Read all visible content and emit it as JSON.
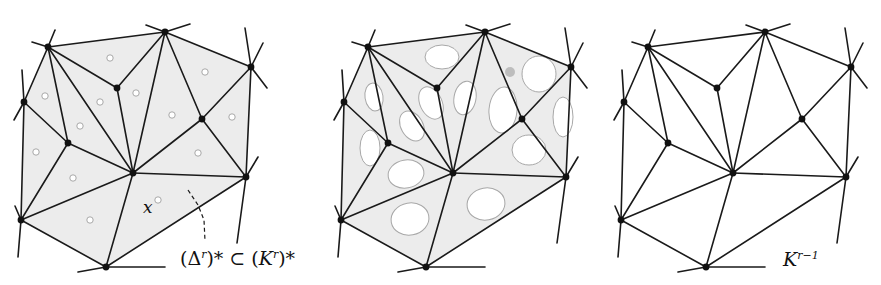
{
  "figure": {
    "panels": [
      {
        "id": "panel-1",
        "offset_x": 0,
        "description": "dual complex (Δ^r)* shaded with small cycles"
      },
      {
        "id": "panel-2",
        "offset_x": 320,
        "description": "shaded faces with enlarged cycles"
      },
      {
        "id": "panel-3",
        "offset_x": 600,
        "description": "unshaded complex K^{r-1}"
      }
    ],
    "labels": {
      "point_x": "x",
      "dual_left": "(Δ",
      "dual_sup1": "r",
      "dual_mid": ")* ⊂ (",
      "dual_K": "K",
      "dual_sup2": "r",
      "dual_end": ")*",
      "k_base": "K",
      "k_sup": "r−1"
    },
    "colors": {
      "edge": "#1a1a1a",
      "vertex": "#111111",
      "face_fill": "#ececec",
      "cycle_stroke": "#a8a8a8",
      "cycle_fill": "#ffffff",
      "background": "#ffffff"
    },
    "vertices": {
      "A": [
        48,
        47
      ],
      "B": [
        165,
        32
      ],
      "C": [
        251,
        67
      ],
      "D": [
        24,
        102
      ],
      "E": [
        117,
        88
      ],
      "F": [
        68,
        143
      ],
      "G": [
        133,
        173
      ],
      "H": [
        202,
        119
      ],
      "I": [
        246,
        177
      ],
      "J": [
        21,
        220
      ],
      "K": [
        106,
        267
      ]
    },
    "edges": [
      [
        "A",
        "B"
      ],
      [
        "B",
        "C"
      ],
      [
        "A",
        "D"
      ],
      [
        "A",
        "E"
      ],
      [
        "E",
        "B"
      ],
      [
        "A",
        "F"
      ],
      [
        "A",
        "G"
      ],
      [
        "D",
        "F"
      ],
      [
        "F",
        "G"
      ],
      [
        "D",
        "J"
      ],
      [
        "F",
        "J"
      ],
      [
        "J",
        "G"
      ],
      [
        "J",
        "K"
      ],
      [
        "K",
        "G"
      ],
      [
        "K",
        "I"
      ],
      [
        "G",
        "I"
      ],
      [
        "G",
        "E"
      ],
      [
        "G",
        "B"
      ],
      [
        "B",
        "H"
      ],
      [
        "H",
        "C"
      ],
      [
        "C",
        "I"
      ],
      [
        "H",
        "G"
      ],
      [
        "H",
        "I"
      ]
    ],
    "stubs": [
      [
        [
          48,
          47
        ],
        [
          32,
          42
        ]
      ],
      [
        [
          48,
          47
        ],
        [
          55,
          30
        ]
      ],
      [
        [
          165,
          32
        ],
        [
          146,
          25
        ]
      ],
      [
        [
          165,
          32
        ],
        [
          190,
          24
        ]
      ],
      [
        [
          251,
          67
        ],
        [
          245,
          28
        ]
      ],
      [
        [
          251,
          67
        ],
        [
          263,
          43
        ]
      ],
      [
        [
          251,
          67
        ],
        [
          267,
          88
        ]
      ],
      [
        [
          24,
          102
        ],
        [
          22,
          70
        ]
      ],
      [
        [
          24,
          102
        ],
        [
          14,
          120
        ]
      ],
      [
        [
          21,
          220
        ],
        [
          15,
          206
        ]
      ],
      [
        [
          21,
          220
        ],
        [
          18,
          257
        ]
      ],
      [
        [
          106,
          267
        ],
        [
          78,
          272
        ]
      ],
      [
        [
          106,
          267
        ],
        [
          165,
          267
        ]
      ],
      [
        [
          246,
          177
        ],
        [
          258,
          157
        ]
      ],
      [
        [
          246,
          177
        ],
        [
          237,
          243
        ]
      ]
    ],
    "small_cycles": [
      [
        110,
        58
      ],
      [
        45,
        96
      ],
      [
        100,
        102
      ],
      [
        136,
        93
      ],
      [
        80,
        126
      ],
      [
        172,
        115
      ],
      [
        36,
        152
      ],
      [
        205,
        72
      ],
      [
        232,
        117
      ],
      [
        198,
        153
      ],
      [
        73,
        178
      ],
      [
        158,
        200
      ],
      [
        90,
        220
      ]
    ],
    "large_cycles": [
      {
        "cx": 122,
        "cy": 57,
        "rx": 17,
        "ry": 12,
        "rot": 0
      },
      {
        "cx": 54,
        "cy": 97,
        "rx": 9,
        "ry": 14,
        "rot": -8
      },
      {
        "cx": 111,
        "cy": 103,
        "rx": 11,
        "ry": 17,
        "rot": -25
      },
      {
        "cx": 145,
        "cy": 98,
        "rx": 11,
        "ry": 17,
        "rot": 10
      },
      {
        "cx": 92,
        "cy": 126,
        "rx": 11,
        "ry": 16,
        "rot": -30
      },
      {
        "cx": 183,
        "cy": 110,
        "rx": 14,
        "ry": 23,
        "rot": 5
      },
      {
        "cx": 50,
        "cy": 148,
        "rx": 10,
        "ry": 18,
        "rot": 0
      },
      {
        "cx": 219,
        "cy": 74,
        "rx": 17,
        "ry": 18,
        "rot": 0
      },
      {
        "cx": 243,
        "cy": 117,
        "rx": 10,
        "ry": 20,
        "rot": 0
      },
      {
        "cx": 209,
        "cy": 150,
        "rx": 17,
        "ry": 15,
        "rot": 0
      },
      {
        "cx": 86,
        "cy": 174,
        "rx": 18,
        "ry": 14,
        "rot": -10
      },
      {
        "cx": 166,
        "cy": 204,
        "rx": 19,
        "ry": 16,
        "rot": -10
      },
      {
        "cx": 90,
        "cy": 219,
        "rx": 19,
        "ry": 16,
        "rot": -10
      }
    ],
    "dashed_leader": [
      [
        188,
        190
      ],
      [
        198,
        205
      ],
      [
        204,
        220
      ],
      [
        205,
        241
      ]
    ]
  }
}
